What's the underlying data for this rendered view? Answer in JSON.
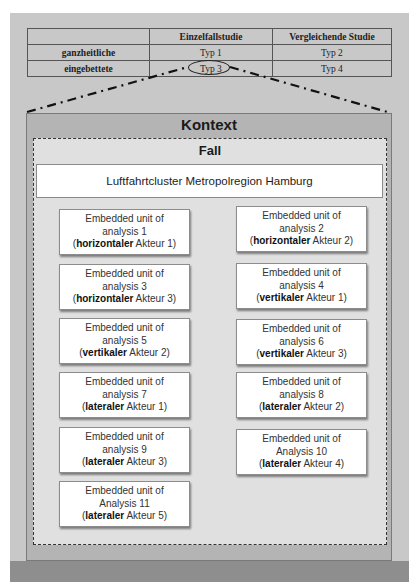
{
  "table": {
    "headers": [
      "",
      "Einzelfallstudie",
      "Vergleichende Studie"
    ],
    "rows": [
      {
        "label": "ganzheitliche",
        "cells": [
          "Typ 1",
          "Typ 2"
        ]
      },
      {
        "label": "eingebettete",
        "cells": [
          "Typ 3",
          "Typ 4"
        ]
      }
    ],
    "highlighted": "Typ 3"
  },
  "kontext": {
    "title": "Kontext"
  },
  "fall": {
    "title": "Fall"
  },
  "cluster": {
    "label": "Luftfahrtcluster Metropolregion Hamburg"
  },
  "units": [
    {
      "line1": "Embedded unit of",
      "line2": "analysis 1",
      "role": "horizontaler",
      "actor": "Akteur 1"
    },
    {
      "line1": "Embedded unit of",
      "line2": "analysis 2",
      "role": "horizontaler",
      "actor": "Akteur 2"
    },
    {
      "line1": "Embedded unit of",
      "line2": "analysis 3",
      "role": "horizontaler",
      "actor": "Akteur 3"
    },
    {
      "line1": "Embedded unit of",
      "line2": "analysis 4",
      "role": "vertikaler",
      "actor": "Akteur 1"
    },
    {
      "line1": "Embedded unit of",
      "line2": "analysis 5",
      "role": "vertikaler",
      "actor": "Akteur 2"
    },
    {
      "line1": "Embedded unit of",
      "line2": "analysis 6",
      "role": "vertikaler",
      "actor": "Akteur 3"
    },
    {
      "line1": "Embedded unit of",
      "line2": "analysis 7",
      "role": "lateraler",
      "actor": "Akteur 1"
    },
    {
      "line1": "Embedded unit of",
      "line2": "analysis 8",
      "role": "lateraler",
      "actor": "Akteur 2"
    },
    {
      "line1": "Embedded unit of",
      "line2": "analysis 9",
      "role": "lateraler",
      "actor": "Akteur 3"
    },
    {
      "line1": "Embedded unit of",
      "line2": "Analysis 10",
      "role": "lateraler",
      "actor": "Akteur 4"
    },
    {
      "line1": "Embedded unit of",
      "line2": "Analysis 11",
      "role": "lateraler",
      "actor": "Akteur 5"
    }
  ],
  "colors": {
    "outer_dark": "#8e8e8e",
    "outer_light": "#c8c8c8",
    "kontext_bg": "#b4b4b4",
    "fall_bg": "#e0e0e0",
    "unit_bg": "#ffffff"
  }
}
